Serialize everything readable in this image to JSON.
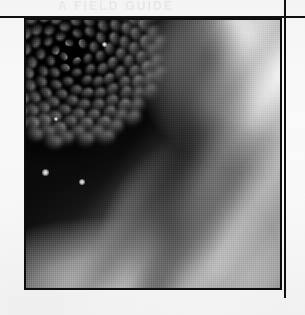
{
  "page": {
    "width": 305,
    "height": 315,
    "background_color": "#f7f7f7",
    "rule_color": "#101010",
    "running_head_ghost": "A FIELD GUIDE"
  },
  "rules": {
    "horizontal": {
      "x": 0,
      "y": 16,
      "length": 305,
      "thickness": 2
    },
    "vertical": {
      "x": 284,
      "y": 0,
      "length": 298,
      "thickness": 2
    }
  },
  "figure": {
    "name": "flower-disc-macro",
    "caption": "",
    "frame": {
      "x": 24,
      "y": 18,
      "width": 258,
      "height": 272,
      "border_color": "#0d0d0d",
      "border_width": 2
    },
    "palette": {
      "darkest": "#050505",
      "shadow": "#1a1a1a",
      "midtone": "#8d8d8d",
      "highlight": "#ededed",
      "specular": "#ffffff"
    },
    "spiral": {
      "center_x_pct": 17,
      "center_y_pct": 12,
      "arms": 21,
      "florets_per_arm": 9,
      "golden_angle_deg": 137.5
    },
    "pollen_speculars": [
      {
        "x_pct": 7.5,
        "y_pct": 57,
        "size": 7
      },
      {
        "x_pct": 22,
        "y_pct": 60.5,
        "size": 6
      },
      {
        "x_pct": 31,
        "y_pct": 9,
        "size": 5
      },
      {
        "x_pct": 12,
        "y_pct": 37,
        "size": 4
      }
    ]
  }
}
